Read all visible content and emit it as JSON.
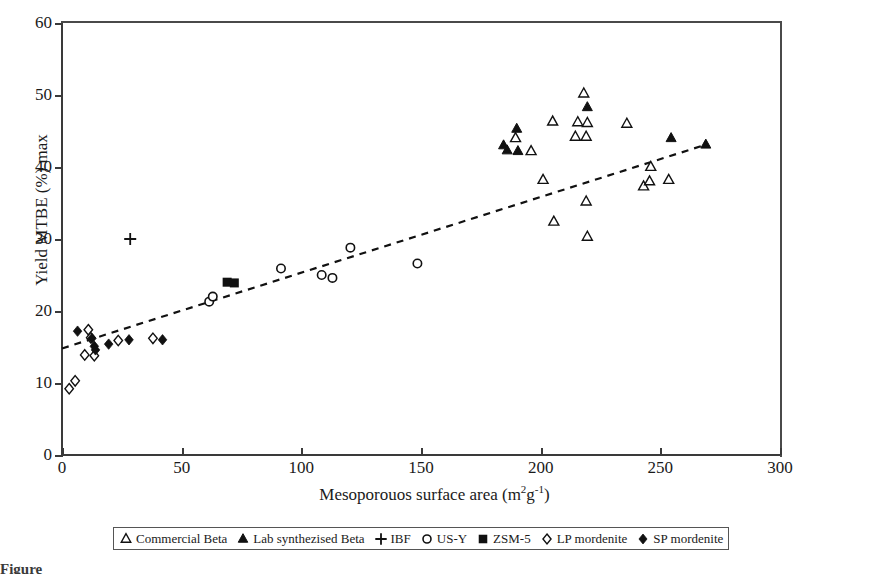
{
  "chart_data": {
    "type": "scatter",
    "title": "",
    "xlabel": "Mesoporouos surface area (m2g-1)",
    "ylabel": "Yield MTBE (%) max",
    "xlabel_main": "Mesoporouos surface area (m",
    "xlabel_sup1": "2",
    "xlabel_mid": "g",
    "xlabel_sup2": "-1",
    "xlabel_end": ")",
    "xlim": [
      0,
      300
    ],
    "ylim": [
      0,
      60
    ],
    "xticks": [
      0,
      50,
      100,
      150,
      200,
      250,
      300
    ],
    "yticks": [
      0,
      10,
      20,
      30,
      40,
      50,
      60
    ],
    "grid": false,
    "legend_position": "below-axis",
    "trendline": {
      "style": "dashed",
      "x": [
        0,
        270
      ],
      "y": [
        14.8,
        43.2
      ]
    },
    "series": [
      {
        "name": "Commercial Beta",
        "marker": "open-triangle",
        "points": [
          [
            189.5,
            44.0
          ],
          [
            196.0,
            42.2
          ],
          [
            205.0,
            46.3
          ],
          [
            214.5,
            44.2
          ],
          [
            218.0,
            50.2
          ],
          [
            215.5,
            46.2
          ],
          [
            219.5,
            46.1
          ],
          [
            219.0,
            44.2
          ],
          [
            236.0,
            46.0
          ],
          [
            243.0,
            37.3
          ],
          [
            245.5,
            38.0
          ],
          [
            253.5,
            38.2
          ],
          [
            246.0,
            40.0
          ],
          [
            201.0,
            38.2
          ],
          [
            219.0,
            35.2
          ],
          [
            205.5,
            32.4
          ],
          [
            219.5,
            30.3
          ]
        ]
      },
      {
        "name": "Lab synthezised Beta",
        "marker": "filled-triangle",
        "points": [
          [
            184.5,
            43.0
          ],
          [
            186.0,
            42.3
          ],
          [
            190.0,
            45.3
          ],
          [
            190.5,
            42.2
          ],
          [
            219.5,
            48.3
          ],
          [
            254.5,
            44.0
          ],
          [
            269.0,
            43.1
          ]
        ]
      },
      {
        "name": "IBF",
        "marker": "plus",
        "points": [
          [
            28.5,
            30.0
          ]
        ]
      },
      {
        "name": "US-Y",
        "marker": "open-circle",
        "points": [
          [
            61.5,
            21.3
          ],
          [
            63.0,
            22.0
          ],
          [
            91.5,
            25.9
          ],
          [
            108.5,
            25.0
          ],
          [
            113.0,
            24.6
          ],
          [
            120.5,
            28.8
          ],
          [
            148.5,
            26.6
          ]
        ]
      },
      {
        "name": "ZSM-5",
        "marker": "filled-square",
        "points": [
          [
            69.0,
            24.0
          ],
          [
            72.0,
            23.9
          ]
        ]
      },
      {
        "name": "LP mordenite",
        "marker": "open-diamond",
        "points": [
          [
            3.0,
            9.2
          ],
          [
            5.5,
            10.3
          ],
          [
            11.0,
            17.4
          ],
          [
            12.0,
            16.3
          ],
          [
            9.5,
            13.9
          ],
          [
            13.5,
            13.8
          ],
          [
            23.5,
            15.9
          ],
          [
            38.0,
            16.2
          ]
        ]
      },
      {
        "name": "SP mordenite",
        "marker": "filled-diamond",
        "points": [
          [
            6.5,
            17.2
          ],
          [
            12.5,
            16.2
          ],
          [
            13.5,
            15.1
          ],
          [
            14.0,
            14.6
          ],
          [
            19.5,
            15.4
          ],
          [
            28.0,
            16.0
          ],
          [
            42.0,
            16.0
          ]
        ]
      }
    ]
  },
  "legend": {
    "items": [
      {
        "marker": "open-triangle",
        "label": "Commercial Beta"
      },
      {
        "marker": "filled-triangle",
        "label": "Lab synthezised Beta"
      },
      {
        "marker": "plus",
        "label": "IBF"
      },
      {
        "marker": "open-circle",
        "label": "US-Y"
      },
      {
        "marker": "filled-square",
        "label": "ZSM-5"
      },
      {
        "marker": "open-diamond",
        "label": "LP mordenite"
      },
      {
        "marker": "filled-diamond",
        "label": "SP mordenite"
      }
    ]
  },
  "colors": {
    "marker": "#111111",
    "axis": "#3a3a3a",
    "text": "#1a1a1a",
    "background": "#ffffff"
  },
  "caption": {
    "text": "Figure"
  }
}
